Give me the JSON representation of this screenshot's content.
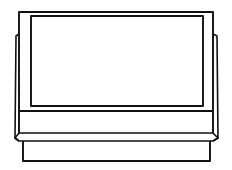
{
  "illustration": {
    "subject": "television-set",
    "style": "line-art",
    "colors": {
      "stroke": "#111111",
      "background": "#ffffff"
    }
  }
}
